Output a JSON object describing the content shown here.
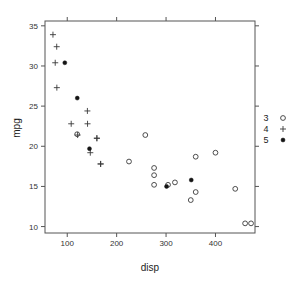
{
  "chart_data": {
    "type": "scatter",
    "title": "",
    "xlabel": "disp",
    "ylabel": "mpg",
    "xlim": [
      55,
      480
    ],
    "ylim": [
      9.2,
      35.6
    ],
    "xticks": [
      100,
      200,
      300,
      400
    ],
    "yticks": [
      10,
      15,
      20,
      25,
      30,
      35
    ],
    "grid": false,
    "legend": {
      "position": "right",
      "title": "",
      "entries": [
        {
          "label": "3",
          "marker": "open-circle"
        },
        {
          "label": "4",
          "marker": "plus"
        },
        {
          "label": "5",
          "marker": "filled-circle"
        }
      ]
    },
    "series": [
      {
        "name": "3",
        "marker": "open-circle",
        "points": [
          {
            "x": 258.0,
            "y": 21.4
          },
          {
            "x": 360.0,
            "y": 18.7
          },
          {
            "x": 225.0,
            "y": 18.1
          },
          {
            "x": 360.0,
            "y": 14.3
          },
          {
            "x": 275.8,
            "y": 17.3
          },
          {
            "x": 275.8,
            "y": 16.4
          },
          {
            "x": 275.8,
            "y": 15.2
          },
          {
            "x": 472.0,
            "y": 10.4
          },
          {
            "x": 460.0,
            "y": 10.4
          },
          {
            "x": 440.0,
            "y": 14.7
          },
          {
            "x": 318.0,
            "y": 15.5
          },
          {
            "x": 304.0,
            "y": 15.2
          },
          {
            "x": 350.0,
            "y": 13.3
          },
          {
            "x": 400.0,
            "y": 19.2
          },
          {
            "x": 120.1,
            "y": 21.5
          }
        ]
      },
      {
        "name": "4",
        "marker": "plus",
        "points": [
          {
            "x": 160.0,
            "y": 21.0
          },
          {
            "x": 160.0,
            "y": 21.0
          },
          {
            "x": 108.0,
            "y": 22.8
          },
          {
            "x": 146.7,
            "y": 19.2
          },
          {
            "x": 140.8,
            "y": 24.4
          },
          {
            "x": 167.6,
            "y": 17.8
          },
          {
            "x": 167.6,
            "y": 17.8
          },
          {
            "x": 71.1,
            "y": 33.9
          },
          {
            "x": 78.7,
            "y": 32.4
          },
          {
            "x": 75.7,
            "y": 30.4
          },
          {
            "x": 79.0,
            "y": 27.3
          },
          {
            "x": 121.0,
            "y": 21.4
          },
          {
            "x": 141.1,
            "y": 22.8
          }
        ]
      },
      {
        "name": "5",
        "marker": "filled-circle",
        "points": [
          {
            "x": 120.3,
            "y": 26.0
          },
          {
            "x": 95.1,
            "y": 30.4
          },
          {
            "x": 351.0,
            "y": 15.8
          },
          {
            "x": 145.0,
            "y": 19.7
          },
          {
            "x": 301.0,
            "y": 15.0
          }
        ]
      }
    ]
  }
}
